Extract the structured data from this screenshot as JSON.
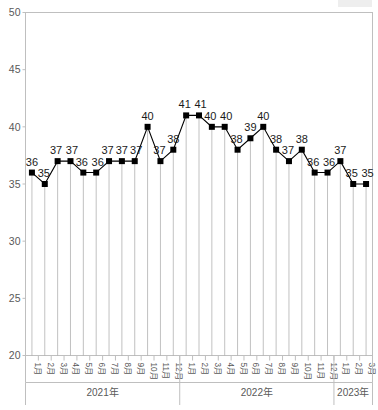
{
  "chart_data": {
    "type": "line",
    "title": "",
    "subtitle": "",
    "xlabel": "",
    "ylabel": "",
    "ylim": [
      20,
      50
    ],
    "ytick_values": [
      20,
      25,
      30,
      35,
      40,
      45,
      50
    ],
    "ytick_labels": [
      "20",
      "25",
      "30",
      "35",
      "40",
      "45",
      "50"
    ],
    "grid": false,
    "legend": "none",
    "marker": "square",
    "marker_color": "#000000",
    "line_color": "#000000",
    "droplines": true,
    "dropline_color": "#a6a6a6",
    "show_data_labels": true,
    "categories": [
      "1月",
      "2月",
      "3月",
      "4月",
      "5月",
      "6月",
      "7月",
      "8月",
      "9月",
      "10月",
      "11月",
      "12月",
      "1月",
      "2月",
      "3月",
      "4月",
      "5月",
      "6月",
      "7月",
      "8月",
      "9月",
      "10月",
      "11月",
      "12月",
      "1月",
      "2月",
      "3月"
    ],
    "values": [
      36,
      35,
      37,
      37,
      36,
      36,
      37,
      37,
      37,
      40,
      37,
      38,
      41,
      41,
      40,
      40,
      38,
      39,
      40,
      38,
      37,
      38,
      36,
      36,
      37,
      35,
      35
    ],
    "data_labels": [
      "36",
      "35",
      "37",
      "37",
      "36",
      "36",
      "37",
      "37",
      "37",
      "40",
      "37",
      "38",
      "41",
      "41",
      "40",
      "40",
      "38",
      "39",
      "40",
      "38",
      "37",
      "38",
      "36",
      "36",
      "37",
      "35",
      "35"
    ],
    "groups": [
      {
        "label": "2021年",
        "start_index": 0,
        "count": 12
      },
      {
        "label": "2022年",
        "start_index": 12,
        "count": 12
      },
      {
        "label": "2023年",
        "start_index": 24,
        "count": 3
      }
    ]
  }
}
